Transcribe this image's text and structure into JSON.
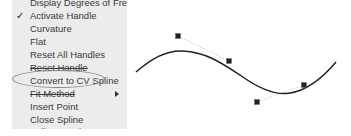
{
  "menu": {
    "items": [
      {
        "label": "Display Degrees of Freedom",
        "checked": false,
        "submenu": false
      },
      {
        "label": "Activate Handle",
        "checked": true,
        "submenu": false
      },
      {
        "label": "Curvature",
        "checked": false,
        "submenu": false
      },
      {
        "label": "Flat",
        "checked": false,
        "submenu": false
      },
      {
        "label": "Reset All Handles",
        "checked": false,
        "submenu": false
      },
      {
        "label": "Reset Handle",
        "checked": false,
        "submenu": false
      },
      {
        "label": "Convert to CV Spline",
        "checked": false,
        "submenu": false,
        "highlighted_by_ellipse": true
      },
      {
        "label": "Fit Method",
        "checked": false,
        "submenu": true
      },
      {
        "label": "Insert Point",
        "checked": false,
        "submenu": false
      },
      {
        "label": "Close Spline",
        "checked": false,
        "submenu": false
      },
      {
        "label": "Spline Tension",
        "checked": false,
        "submenu": false
      }
    ],
    "check_glyph": "✓",
    "annotation_color": "#888888"
  },
  "canvas": {
    "curve_color": "#222222",
    "handle_color": "#222222",
    "handle_line_color": "#cccccc",
    "handles": [
      {
        "x": 178,
        "y": 36
      },
      {
        "x": 229,
        "y": 61
      },
      {
        "x": 257,
        "y": 102
      },
      {
        "x": 304,
        "y": 85
      }
    ]
  }
}
